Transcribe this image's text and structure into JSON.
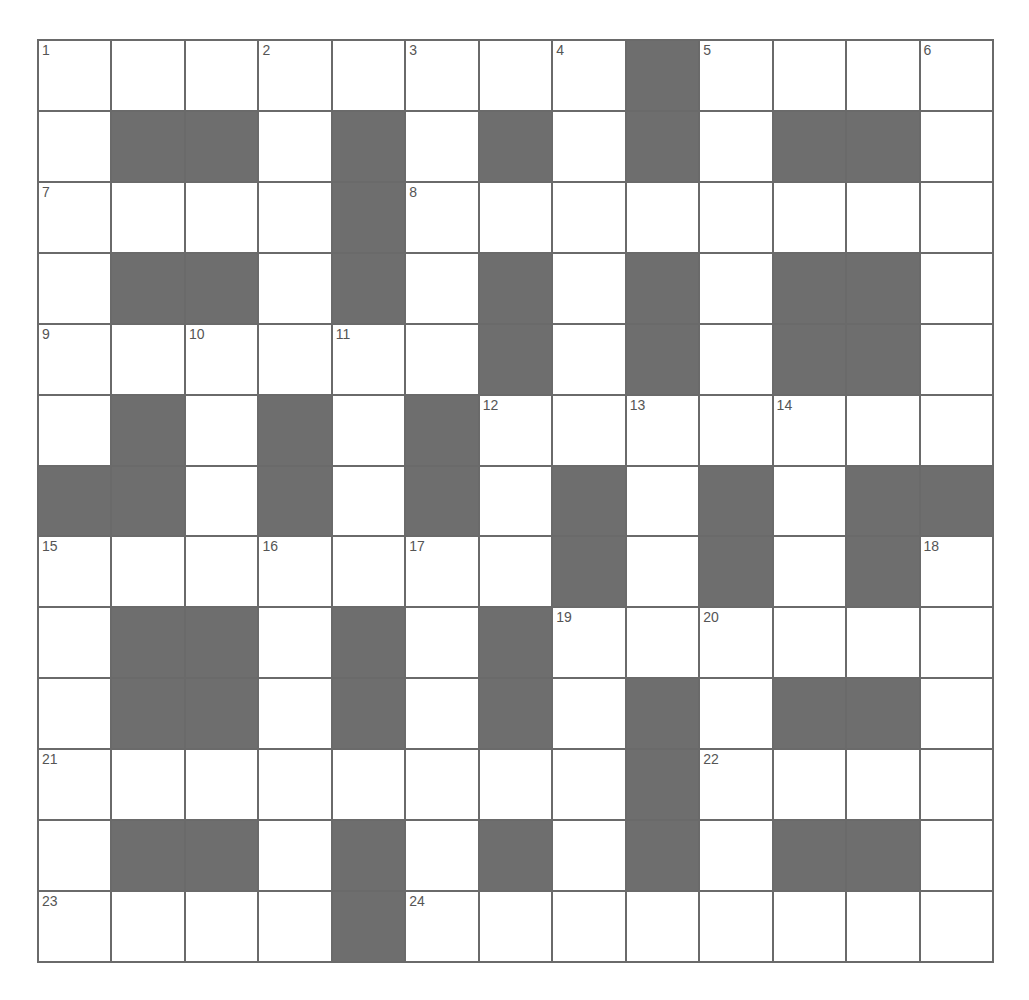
{
  "puzzle": {
    "rows": 13,
    "cols": 13,
    "colors": {
      "black_cell": "#6e6e6e",
      "white_cell": "#ffffff",
      "grid_line": "#6a6a6a",
      "number_text": "#555555"
    },
    "grid": [
      "........#....",
      ".##.#.#.#.##.",
      "....#........",
      ".##.#.#.#.##.",
      "......#.#.##.",
      ".#.#.#.......",
      "##.#.#.#.#.##",
      ".......#.#.#.",
      ".##.#.#......",
      ".##.#.#.#.##.",
      "........#....",
      ".##.#.#.#.##.",
      "....#........"
    ],
    "numbers": [
      {
        "row": 0,
        "col": 0,
        "n": "1"
      },
      {
        "row": 0,
        "col": 3,
        "n": "2"
      },
      {
        "row": 0,
        "col": 5,
        "n": "3"
      },
      {
        "row": 0,
        "col": 7,
        "n": "4"
      },
      {
        "row": 0,
        "col": 9,
        "n": "5"
      },
      {
        "row": 0,
        "col": 12,
        "n": "6"
      },
      {
        "row": 2,
        "col": 0,
        "n": "7"
      },
      {
        "row": 2,
        "col": 5,
        "n": "8"
      },
      {
        "row": 4,
        "col": 0,
        "n": "9"
      },
      {
        "row": 4,
        "col": 2,
        "n": "10"
      },
      {
        "row": 4,
        "col": 4,
        "n": "11"
      },
      {
        "row": 5,
        "col": 6,
        "n": "12"
      },
      {
        "row": 5,
        "col": 8,
        "n": "13"
      },
      {
        "row": 5,
        "col": 10,
        "n": "14"
      },
      {
        "row": 7,
        "col": 0,
        "n": "15"
      },
      {
        "row": 7,
        "col": 3,
        "n": "16"
      },
      {
        "row": 7,
        "col": 5,
        "n": "17"
      },
      {
        "row": 7,
        "col": 12,
        "n": "18"
      },
      {
        "row": 8,
        "col": 7,
        "n": "19"
      },
      {
        "row": 8,
        "col": 9,
        "n": "20"
      },
      {
        "row": 10,
        "col": 0,
        "n": "21"
      },
      {
        "row": 10,
        "col": 9,
        "n": "22"
      },
      {
        "row": 12,
        "col": 0,
        "n": "23"
      },
      {
        "row": 12,
        "col": 5,
        "n": "24"
      }
    ]
  }
}
